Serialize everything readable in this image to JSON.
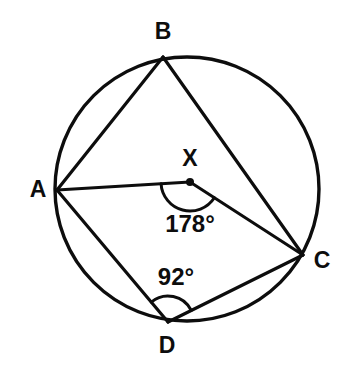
{
  "figure": {
    "background_color": "#ffffff",
    "ink_color": "#0d0d0d"
  },
  "circle": {
    "name": "circumscribed-circle",
    "center_x": 187,
    "center_y": 189,
    "radius": 132,
    "stroke_width": 3.4
  },
  "points": [
    {
      "id": "A",
      "label": "A",
      "x": 57,
      "y": 190,
      "label_x": 38,
      "label_y": 191,
      "on_circle": true,
      "is_center": false
    },
    {
      "id": "B",
      "label": "B",
      "x": 163,
      "y": 57,
      "label_x": 163,
      "label_y": 33,
      "on_circle": true,
      "is_center": false
    },
    {
      "id": "C",
      "label": "C",
      "x": 303,
      "y": 255,
      "label_x": 322,
      "label_y": 262,
      "on_circle": true,
      "is_center": false
    },
    {
      "id": "D",
      "label": "D",
      "x": 168,
      "y": 322,
      "label_x": 167,
      "label_y": 347,
      "on_circle": true,
      "is_center": false
    },
    {
      "id": "X",
      "label": "X",
      "x": 190,
      "y": 182,
      "label_x": 190,
      "label_y": 160,
      "on_circle": false,
      "is_center": true
    }
  ],
  "segments": [
    {
      "id": "AB",
      "from": "A",
      "to": "B",
      "kind": "chord"
    },
    {
      "id": "BC",
      "from": "B",
      "to": "C",
      "kind": "chord"
    },
    {
      "id": "AD",
      "from": "A",
      "to": "D",
      "kind": "chord"
    },
    {
      "id": "DC",
      "from": "D",
      "to": "C",
      "kind": "chord"
    },
    {
      "id": "AX",
      "from": "A",
      "to": "X",
      "kind": "radius"
    },
    {
      "id": "XC",
      "from": "X",
      "to": "C",
      "kind": "radius"
    }
  ],
  "angles": [
    {
      "id": "angle-at-X",
      "vertex": "X",
      "value": "178°",
      "measure_degrees": 178,
      "arms": [
        "A",
        "C"
      ],
      "arc_radius": 29,
      "label_x": 190,
      "label_y": 226
    },
    {
      "id": "angle-at-D",
      "vertex": "D",
      "value": "92°",
      "measure_degrees": 92,
      "arms": [
        "A",
        "C"
      ],
      "arc_radius": 26,
      "label_x": 176,
      "label_y": 279
    }
  ]
}
